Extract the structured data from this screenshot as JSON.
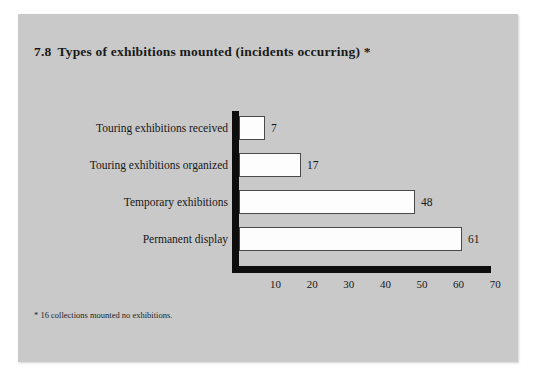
{
  "page": {
    "background_color": "#ffffff",
    "panel_color": "#c9c9c9"
  },
  "title": {
    "number": "7.8",
    "text": "Types of exhibitions mounted (incidents occurring) *",
    "full": "7.8  Types of exhibitions mounted (incidents occurring) *"
  },
  "footnote": "* 16 collections mounted no exhibitions.",
  "chart_data": {
    "type": "bar",
    "orientation": "horizontal",
    "categories": [
      "Touring exhibitions received",
      "Touring exhibitions organized",
      "Temporary exhibitions",
      "Permanent display"
    ],
    "values": [
      7,
      17,
      48,
      61
    ],
    "value_labels": [
      "7",
      "17",
      "48",
      "61"
    ],
    "xlabel": "",
    "ylabel": "",
    "xlim": [
      0,
      73
    ],
    "xticks": [
      10,
      20,
      30,
      40,
      50,
      60,
      70
    ],
    "xtick_labels": [
      "10",
      "20",
      "30",
      "40",
      "50",
      "60",
      "70"
    ],
    "grid": false,
    "legend": false,
    "bar_fill_color": "#fdfdfd",
    "bar_edge_color": "#4a4a4a",
    "axis_color": "#0d0d0d"
  }
}
